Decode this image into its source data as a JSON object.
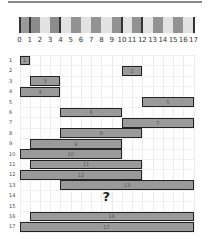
{
  "diagram": {
    "type": "interval-puzzle",
    "header_band": {
      "segments": [
        {
          "from": 0,
          "to": 1,
          "color": "#9a9a9a"
        },
        {
          "from": 1,
          "to": 2,
          "color": "#8c8c8c"
        },
        {
          "from": 2,
          "to": 3,
          "color": "#e2e2e2"
        },
        {
          "from": 3,
          "to": 4,
          "color": "#8c8c8c"
        },
        {
          "from": 4,
          "to": 5,
          "color": "#e2e2e2"
        },
        {
          "from": 5,
          "to": 6,
          "color": "#929292"
        },
        {
          "from": 6,
          "to": 7,
          "color": "#e2e2e2"
        },
        {
          "from": 7,
          "to": 8,
          "color": "#929292"
        },
        {
          "from": 8,
          "to": 9,
          "color": "#e2e2e2"
        },
        {
          "from": 9,
          "to": 10,
          "color": "#929292"
        },
        {
          "from": 10,
          "to": 11,
          "color": "#e2e2e2"
        },
        {
          "from": 11,
          "to": 12,
          "color": "#929292"
        },
        {
          "from": 12,
          "to": 13,
          "color": "#e2e2e2"
        },
        {
          "from": 13,
          "to": 14,
          "color": "#929292"
        },
        {
          "from": 14,
          "to": 15,
          "color": "#e2e2e2"
        },
        {
          "from": 15,
          "to": 16,
          "color": "#929292"
        },
        {
          "from": 16,
          "to": 17,
          "color": "#e2e2e2"
        }
      ],
      "edges": [
        0,
        1,
        4,
        10,
        12,
        17
      ]
    },
    "ticks": [
      "0",
      "1",
      "2",
      "3",
      "4",
      "5",
      "6",
      "7",
      "8",
      "9",
      "10",
      "11",
      "12",
      "13",
      "14",
      "15",
      "16",
      "17"
    ],
    "rows": [
      {
        "label": "1",
        "bar": {
          "start": 0,
          "end": 1,
          "text": "1"
        }
      },
      {
        "label": "2",
        "bar": {
          "start": 10,
          "end": 12,
          "text": "2"
        }
      },
      {
        "label": "3",
        "bar": {
          "start": 1,
          "end": 4,
          "text": "3"
        }
      },
      {
        "label": "4",
        "bar": {
          "start": 0,
          "end": 4,
          "text": "4"
        }
      },
      {
        "label": "5",
        "bar": {
          "start": 12,
          "end": 17,
          "text": "5"
        }
      },
      {
        "label": "6",
        "bar": {
          "start": 4,
          "end": 10,
          "text": "6"
        }
      },
      {
        "label": "7",
        "bar": {
          "start": 10,
          "end": 17,
          "text": "7"
        }
      },
      {
        "label": "8",
        "bar": {
          "start": 4,
          "end": 12,
          "text": "8"
        }
      },
      {
        "label": "9",
        "bar": {
          "start": 1,
          "end": 10,
          "text": "9"
        }
      },
      {
        "label": "10",
        "bar": {
          "start": 0,
          "end": 10,
          "text": "10"
        }
      },
      {
        "label": "11",
        "bar": {
          "start": 1,
          "end": 12,
          "text": "11"
        }
      },
      {
        "label": "12",
        "bar": {
          "start": 0,
          "end": 12,
          "text": "12"
        }
      },
      {
        "label": "13",
        "bar": {
          "start": 4,
          "end": 17,
          "text": "13"
        }
      },
      {
        "label": "14",
        "bar": null,
        "question": "?"
      },
      {
        "label": "15",
        "bar": null
      },
      {
        "label": "16",
        "bar": {
          "start": 1,
          "end": 17,
          "text": "16"
        }
      },
      {
        "label": "17",
        "bar": {
          "start": 0,
          "end": 17,
          "text": "17"
        }
      }
    ],
    "colors": {
      "bar_fill": "#9a9a9a",
      "bar_border": "#222222",
      "grid": "#ececec"
    }
  }
}
